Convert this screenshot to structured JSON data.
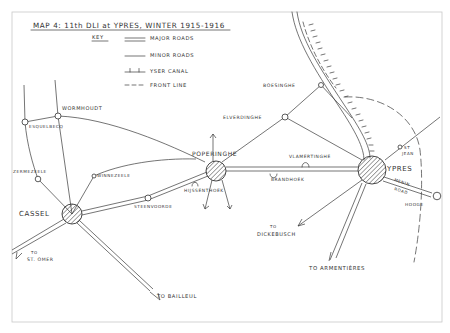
{
  "title": "MAP 4:  11th DLI at YPRES, WINTER 1915-1916",
  "key": {
    "heading": "KEY",
    "items": [
      {
        "symbol": "double-line",
        "label": "MAJOR ROADS"
      },
      {
        "symbol": "single-line",
        "label": "MINOR ROADS"
      },
      {
        "symbol": "ticked-line",
        "label": "YSER CANAL"
      },
      {
        "symbol": "dashed-line",
        "label": "FRONT LINE"
      }
    ]
  },
  "places": {
    "cassel": "CASSEL",
    "poperinghe": "POPERINGHE",
    "ypres": "YPRES",
    "wormhoudt": "WORMHOUDT",
    "esquelbecq": "ESQUELBECQ",
    "zermezeele": "ZERMEZEELE",
    "winnezeele": "WINNEZEELE",
    "steenvoorde": "STEENVOORDE",
    "hijssenthoek": "HIJSSENTHOEK",
    "brandhoek": "BRANDHOEK",
    "vlamertinghe": "VLAMERTINGHE",
    "elverdinghe": "ELVERDINGHE",
    "boesinghe": "BOESINGHE",
    "st_jean_1": "ST",
    "st_jean_2": "JEAN",
    "menin_road_1": "MENIN",
    "menin_road_2": "ROAD",
    "hooge": "HOOGE"
  },
  "directions": {
    "st_omer_1": "TO",
    "st_omer_2": "ST. OMER",
    "bailleul": "TO BAILLEUL",
    "dickebusch_1": "TO",
    "dickebusch_2": "DICKEBUSCH",
    "armentieres": "TO ARMENTIÈRES"
  },
  "colors": {
    "ink": "#333333",
    "paper": "#ffffff",
    "frame": "#c8c8c8"
  }
}
